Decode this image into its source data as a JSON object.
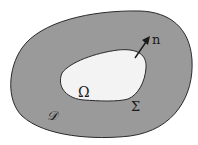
{
  "diagram": {
    "colors": {
      "background": "#ffffff",
      "outer_region": "#9a9a9a",
      "inner_region": "#f3f3f3",
      "stroke": "#2a2a2a"
    },
    "labels": {
      "normal": "n",
      "inner_domain": "Ω",
      "boundary": "Σ",
      "outer_domain": "𝒟"
    },
    "elements": {
      "outer_region": "outer domain D",
      "inner_region": "inner domain Omega",
      "boundary_curve": "boundary Sigma",
      "normal_arrow": "outward normal vector n"
    }
  }
}
